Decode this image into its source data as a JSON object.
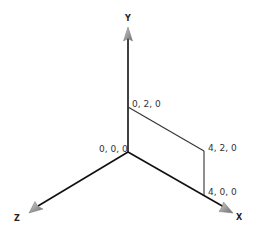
{
  "diagram": {
    "type": "3d-axes-rectangle",
    "axes": {
      "x_label": "X",
      "y_label": "Y",
      "z_label": "Z"
    },
    "points": [
      {
        "name": "origin",
        "label": "0, 0, 0"
      },
      {
        "name": "p-0-2-0",
        "label": "0, 2, 0"
      },
      {
        "name": "p-4-2-0",
        "label": "4, 2, 0"
      },
      {
        "name": "p-4-0-0",
        "label": "4, 0, 0"
      }
    ],
    "colors": {
      "axis": "#111111",
      "rect": "#333333",
      "arrowhead": "#999999",
      "text": "#333333"
    }
  }
}
